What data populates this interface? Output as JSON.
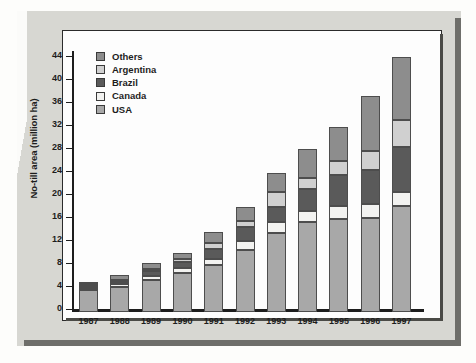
{
  "figure": {
    "y_axis_title": "No-till area (million ha)"
  },
  "legend": {
    "items": [
      {
        "label": "Others",
        "color": "#8d8d8d"
      },
      {
        "label": "Argentina",
        "color": "#d0d0d0"
      },
      {
        "label": "Brazil",
        "color": "#5a5a5a"
      },
      {
        "label": "Canada",
        "color": "#f2f2f0"
      },
      {
        "label": "USA",
        "color": "#a8a8a8"
      }
    ]
  },
  "chart_data": {
    "type": "bar",
    "stacked": true,
    "title": "",
    "xlabel": "",
    "ylabel": "No-till area (million ha)",
    "ylim": [
      0,
      46
    ],
    "yticks": [
      0,
      4,
      8,
      12,
      16,
      20,
      24,
      28,
      32,
      36,
      40,
      44
    ],
    "grid": false,
    "legend_position": "top-left",
    "categories": [
      "1987",
      "1988",
      "1989",
      "1990",
      "1991",
      "1992",
      "1993",
      "1994",
      "1995",
      "1996",
      "1997"
    ],
    "series": [
      {
        "name": "USA",
        "color": "#a8a8a8",
        "values": [
          3.9,
          4.3,
          5.6,
          6.8,
          8.1,
          10.8,
          13.8,
          15.6,
          16.1,
          16.4,
          18.4
        ]
      },
      {
        "name": "Canada",
        "color": "#f2f2f0",
        "values": [
          0.3,
          0.5,
          0.6,
          0.8,
          1.1,
          1.5,
          1.8,
          2.0,
          2.3,
          2.4,
          2.4
        ]
      },
      {
        "name": "Brazil",
        "color": "#5a5a5a",
        "values": [
          0.4,
          0.5,
          0.9,
          1.1,
          1.8,
          2.4,
          2.7,
          3.8,
          5.4,
          5.9,
          7.9
        ]
      },
      {
        "name": "Argentina",
        "color": "#d0d0d0",
        "values": [
          0.2,
          0.3,
          0.4,
          0.6,
          1.0,
          1.1,
          2.5,
          1.9,
          2.4,
          3.3,
          4.7
        ]
      },
      {
        "name": "Others",
        "color": "#8d8d8d",
        "values": [
          0.5,
          0.8,
          1.0,
          1.0,
          1.9,
          2.4,
          3.3,
          5.1,
          6.0,
          9.6,
          10.9
        ]
      }
    ],
    "totals": [
      5.3,
      6.4,
      8.5,
      10.3,
      13.9,
      18.2,
      24.1,
      28.4,
      32.2,
      37.6,
      44.3
    ]
  }
}
